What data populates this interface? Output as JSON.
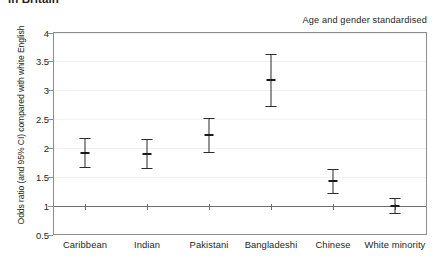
{
  "title": "in Britain",
  "annotation": "Age and gender standardised",
  "chart_data": {
    "type": "scatter",
    "title": "in Britain",
    "subtitle": "Age and gender standardised",
    "xlabel": "",
    "ylabel": "Odds ratio (and 95% CI) compared with white English",
    "ylim": [
      0.5,
      4
    ],
    "yticks": [
      "0.5",
      "1",
      "1.5",
      "2",
      "2.5",
      "3",
      "3.5",
      "4"
    ],
    "ytick_values": [
      0.5,
      1,
      1.5,
      2,
      2.5,
      3,
      3.5,
      4
    ],
    "grid": true,
    "legend": "none",
    "reference_line": 1,
    "categories": [
      "Caribbean",
      "Indian",
      "Pakistani",
      "Bangladeshi",
      "Chinese",
      "White minority"
    ],
    "values": [
      1.92,
      1.9,
      2.23,
      3.17,
      1.42,
      1.0
    ],
    "ci_lower": [
      1.67,
      1.65,
      1.93,
      2.72,
      1.22,
      0.87
    ],
    "ci_upper": [
      2.18,
      2.15,
      2.52,
      3.63,
      1.63,
      1.13
    ],
    "points": [
      {
        "category": "Caribbean",
        "value": 1.92,
        "ci_lower": 1.67,
        "ci_upper": 2.18
      },
      {
        "category": "Indian",
        "value": 1.9,
        "ci_lower": 1.65,
        "ci_upper": 2.15
      },
      {
        "category": "Pakistani",
        "value": 2.23,
        "ci_lower": 1.93,
        "ci_upper": 2.52
      },
      {
        "category": "Bangladeshi",
        "value": 3.17,
        "ci_lower": 2.72,
        "ci_upper": 3.63
      },
      {
        "category": "Chinese",
        "value": 1.42,
        "ci_lower": 1.22,
        "ci_upper": 1.63
      },
      {
        "category": "White minority",
        "value": 1.0,
        "ci_lower": 0.87,
        "ci_upper": 1.13
      }
    ],
    "colors": {
      "marker": "#1a1a1a",
      "errorbar": "#2b2b2b",
      "axis": "#8d8d8d",
      "gridline": "#f2f2f2",
      "reference_line": "#6d6d6d",
      "text": "#231f20"
    }
  }
}
